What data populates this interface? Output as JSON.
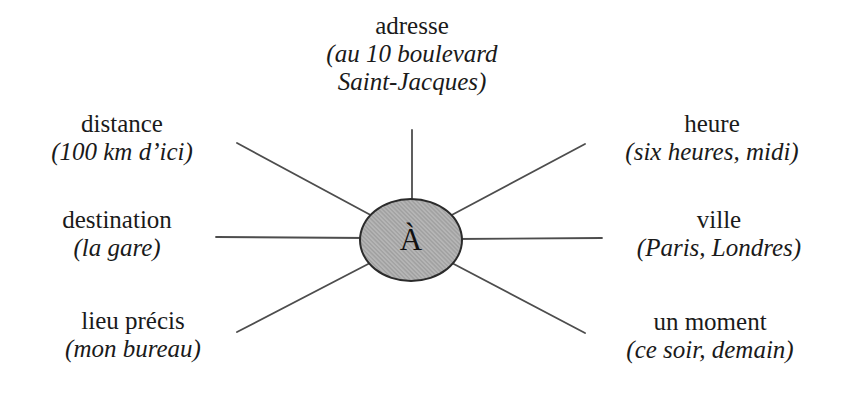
{
  "colors": {
    "background": "#ffffff",
    "ellipse_fill": "#a9a9a9",
    "ellipse_border": "#2b2b2b",
    "spoke_line": "#4d4d4d",
    "text": "#1a1a1a"
  },
  "diagram": {
    "center_label": "À",
    "nodes": [
      {
        "title": "adresse",
        "example": "(au 10 boulevard\nSaint-Jacques)"
      },
      {
        "title": "distance",
        "example": "(100 km d’ici)"
      },
      {
        "title": "destination",
        "example": "(la gare)"
      },
      {
        "title": "lieu précis",
        "example": "(mon bureau)"
      },
      {
        "title": "heure",
        "example": "(six heures, midi)"
      },
      {
        "title": "ville",
        "example": "(Paris, Londres)"
      },
      {
        "title": "un moment",
        "example": "(ce soir, demain)"
      }
    ]
  }
}
